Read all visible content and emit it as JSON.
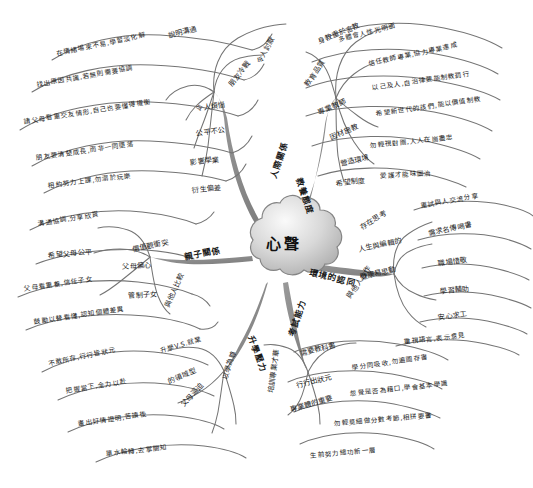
{
  "diagram": {
    "type": "mind-map",
    "title": "心聲",
    "center": {
      "label": "心聲",
      "shape": "cloud",
      "fill_light": "#f2f2f2",
      "fill_dark": "#b9b9b9",
      "stroke": "#7a7a7a"
    },
    "style": {
      "branch_color": "#8a8a8a",
      "leaf_line_color": "#6f6f6f",
      "text_color": "#1a1a1a",
      "background": "#ffffff"
    },
    "branches": [
      {
        "id": "interpersonal",
        "label": "人際關係",
        "label_x": 272,
        "label_y": 172,
        "label_rot": -72,
        "children": [
          {
            "label": "說明溝通",
            "x": 168,
            "y": 30,
            "rot": -14
          },
          {
            "label": "令人討厭",
            "x": 258,
            "y": 58,
            "rot": -62
          },
          {
            "label": "朋友冷戰",
            "x": 230,
            "y": 80,
            "rot": -52
          },
          {
            "label": "令人煩惱",
            "x": 196,
            "y": 103,
            "rot": -8
          },
          {
            "label": "公平不公",
            "x": 196,
            "y": 128,
            "rot": -8
          },
          {
            "label": "影響學業",
            "x": 190,
            "y": 157,
            "rot": -6
          },
          {
            "label": "衍生偏差",
            "x": 192,
            "y": 185,
            "rot": -6
          },
          {
            "label": "在情緒場來不易,學習淡化解",
            "x": 56,
            "y": 48,
            "rot": -12
          },
          {
            "label": "找出原因共識,若無則需要協調",
            "x": 36,
            "y": 79,
            "rot": -10
          },
          {
            "label": "請父母看重交友情形,自己也要懂得權衡",
            "x": 24,
            "y": 116,
            "rot": -9
          },
          {
            "label": "朋友要清楚成長,而非一同墮落",
            "x": 36,
            "y": 152,
            "rot": -8
          },
          {
            "label": "相約努力上課,勿溺於玩樂",
            "x": 48,
            "y": 180,
            "rot": -7
          }
        ]
      },
      {
        "id": "education",
        "label": "教養態度",
        "label_x": 300,
        "label_y": 172,
        "label_rot": 72,
        "children": [
          {
            "label": "身教重於言教",
            "x": 318,
            "y": 36,
            "rot": -22
          },
          {
            "label": "教育品質",
            "x": 306,
            "y": 80,
            "rot": -56
          },
          {
            "label": "專業教師",
            "x": 318,
            "y": 107,
            "rot": -24
          },
          {
            "label": "因材施教",
            "x": 330,
            "y": 132,
            "rot": -22
          },
          {
            "label": "營造環境",
            "x": 340,
            "y": 158,
            "rot": -12
          },
          {
            "label": "希望制度",
            "x": 336,
            "y": 178,
            "rot": -6
          },
          {
            "label": "多體會人性光明面",
            "x": 338,
            "y": 34,
            "rot": -14
          },
          {
            "label": "信任教師專業,協力專業達成",
            "x": 368,
            "y": 58,
            "rot": -12
          },
          {
            "label": "以己及人,自治律要能制教罰行",
            "x": 372,
            "y": 82,
            "rot": -8
          },
          {
            "label": "希望新世代的孩們,能以價值制教",
            "x": 376,
            "y": 108,
            "rot": -8
          },
          {
            "label": "勿輕視對團,人人在崗盡忠",
            "x": 370,
            "y": 140,
            "rot": -6
          },
          {
            "label": "愛護才能味圖治",
            "x": 380,
            "y": 170,
            "rot": -3
          }
        ]
      },
      {
        "id": "parenting",
        "label": "親子關係",
        "label_x": 184,
        "label_y": 250,
        "label_rot": -11,
        "children": [
          {
            "label": "價值觀衝突",
            "x": 132,
            "y": 244,
            "rot": -12
          },
          {
            "label": "父母偏心",
            "x": 122,
            "y": 261,
            "rot": -3
          },
          {
            "label": "管制子女",
            "x": 128,
            "y": 290,
            "rot": -3
          },
          {
            "label": "與他人比較",
            "x": 166,
            "y": 302,
            "rot": -66
          },
          {
            "label": "溝通協調,分享欣賞",
            "x": 38,
            "y": 218,
            "rot": -9
          },
          {
            "label": "希望父母公平",
            "x": 48,
            "y": 250,
            "rot": -5
          },
          {
            "label": "父母看重養,信任子女",
            "x": 24,
            "y": 283,
            "rot": -8
          },
          {
            "label": "鼓勵以替看懂,認知個體差異",
            "x": 34,
            "y": 316,
            "rot": -8
          }
        ]
      },
      {
        "id": "environment",
        "label": "環境的認同",
        "label_x": 310,
        "label_y": 265,
        "label_rot": 14,
        "children": [
          {
            "label": "存在思考",
            "x": 360,
            "y": 222,
            "rot": -30
          },
          {
            "label": "人生與編輯的",
            "x": 358,
            "y": 244,
            "rot": -12
          },
          {
            "label": "健康易思動",
            "x": 360,
            "y": 272,
            "rot": -14
          },
          {
            "label": "與他人合作",
            "x": 348,
            "y": 292,
            "rot": -56
          },
          {
            "label": "重試與人交流分享",
            "x": 420,
            "y": 200,
            "rot": -10
          },
          {
            "label": "需求名傳喝書",
            "x": 428,
            "y": 228,
            "rot": -12
          },
          {
            "label": "職場惜敬",
            "x": 438,
            "y": 258,
            "rot": -8
          },
          {
            "label": "學習輔助",
            "x": 440,
            "y": 286,
            "rot": -6
          },
          {
            "label": "安心求工",
            "x": 438,
            "y": 312,
            "rot": -8
          },
          {
            "label": "重視語言,表示意見",
            "x": 404,
            "y": 336,
            "rot": -6
          }
        ]
      },
      {
        "id": "studypressure",
        "label": "升學壓力",
        "label_x": 252,
        "label_y": 330,
        "label_rot": 70,
        "children": [
          {
            "label": "升學V.S.就業",
            "x": 160,
            "y": 345,
            "rot": -16
          },
          {
            "label": "的領域型",
            "x": 168,
            "y": 376,
            "rot": -22
          },
          {
            "label": "父母逼迫",
            "x": 182,
            "y": 400,
            "rot": -48
          },
          {
            "label": "以學為尊",
            "x": 224,
            "y": 374,
            "rot": -72
          },
          {
            "label": "不敢所存,行行皆狀元",
            "x": 48,
            "y": 358,
            "rot": -12
          },
          {
            "label": "把握當下,全力以赴",
            "x": 66,
            "y": 385,
            "rot": -9
          },
          {
            "label": "畫出好情證明,苦讀後",
            "x": 78,
            "y": 418,
            "rot": -8
          },
          {
            "label": "單水輪轉,去掌關知",
            "x": 106,
            "y": 448,
            "rot": -6
          }
        ]
      },
      {
        "id": "studyability",
        "label": "考試能力",
        "label_x": 290,
        "label_y": 330,
        "label_rot": -72,
        "children": [
          {
            "label": "需要教科書",
            "x": 300,
            "y": 348,
            "rot": -14
          },
          {
            "label": "行行出狀元",
            "x": 296,
            "y": 380,
            "rot": -14
          },
          {
            "label": "專業體的重要",
            "x": 290,
            "y": 404,
            "rot": -16
          },
          {
            "label": "培訓專業才華",
            "x": 270,
            "y": 388,
            "rot": -82
          },
          {
            "label": "學分同吸收,勿遍圖存書",
            "x": 352,
            "y": 362,
            "rot": -8
          },
          {
            "label": "忽覺是否為藉口,學會基本學識",
            "x": 350,
            "y": 388,
            "rot": -6
          },
          {
            "label": "勿輕莫細做分數考節,相拼要書",
            "x": 334,
            "y": 418,
            "rot": -5
          },
          {
            "label": "生前努力總功新一層",
            "x": 310,
            "y": 450,
            "rot": -5
          }
        ]
      }
    ]
  }
}
